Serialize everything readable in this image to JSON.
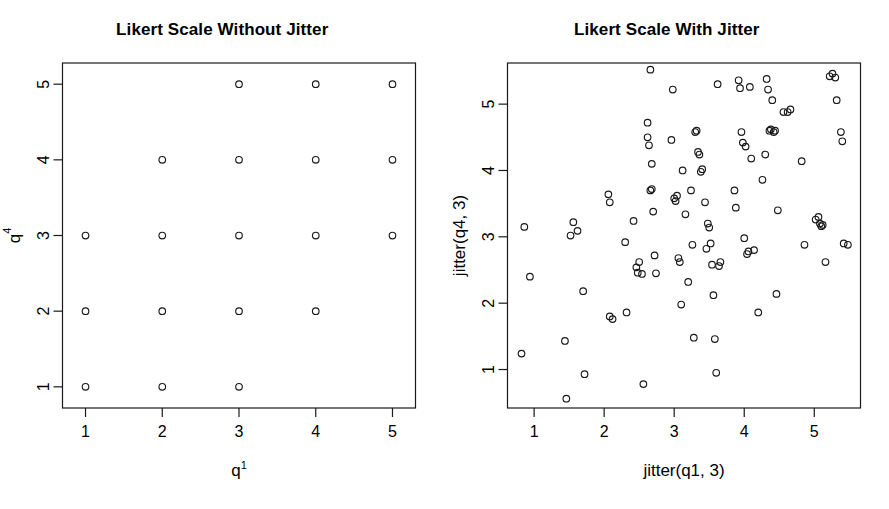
{
  "figure": {
    "background": "#ffffff",
    "foreground": "#1a1a1a",
    "panel_count": 2
  },
  "panels": [
    {
      "title": "Likert Scale Without Jitter",
      "xlabel_base": "q",
      "xlabel_sup": "1",
      "ylabel_base": "q",
      "ylabel_sup": "4",
      "xticks": [
        "1",
        "2",
        "3",
        "4",
        "5"
      ],
      "yticks": [
        "1",
        "2",
        "3",
        "4",
        "5"
      ]
    },
    {
      "title": "Likert Scale With Jitter",
      "xlabel_base": "jitter(q1, 3)",
      "xlabel_sup": "",
      "ylabel_base": "jitter(q4, 3)",
      "ylabel_sup": "",
      "xticks": [
        "1",
        "2",
        "3",
        "4",
        "5"
      ],
      "yticks": [
        "1",
        "2",
        "3",
        "4",
        "5"
      ]
    }
  ],
  "chart_data": [
    {
      "type": "scatter",
      "title": "Likert Scale Without Jitter",
      "xlabel": "q1",
      "ylabel": "q4",
      "xlim": [
        0.7,
        5.3
      ],
      "ylim": [
        0.72,
        5.28
      ],
      "xticks": [
        1,
        2,
        3,
        4,
        5
      ],
      "yticks": [
        1,
        2,
        3,
        4,
        5
      ],
      "grid": false,
      "legend": null,
      "marker": "open-circle",
      "points": [
        [
          1,
          1
        ],
        [
          2,
          1
        ],
        [
          3,
          1
        ],
        [
          1,
          2
        ],
        [
          2,
          2
        ],
        [
          3,
          2
        ],
        [
          4,
          2
        ],
        [
          1,
          3
        ],
        [
          2,
          3
        ],
        [
          3,
          3
        ],
        [
          4,
          3
        ],
        [
          5,
          3
        ],
        [
          2,
          4
        ],
        [
          3,
          4
        ],
        [
          4,
          4
        ],
        [
          5,
          4
        ],
        [
          3,
          5
        ],
        [
          4,
          5
        ],
        [
          5,
          5
        ]
      ]
    },
    {
      "type": "scatter",
      "title": "Likert Scale With Jitter",
      "xlabel": "jitter(q1, 3)",
      "ylabel": "jitter(q4, 3)",
      "xlim": [
        0.62,
        5.66
      ],
      "ylim": [
        0.42,
        5.62
      ],
      "xticks": [
        1,
        2,
        3,
        4,
        5
      ],
      "yticks": [
        1,
        2,
        3,
        4,
        5
      ],
      "grid": false,
      "legend": null,
      "marker": "open-circle",
      "points": [
        [
          0.86,
          3.15
        ],
        [
          0.94,
          2.4
        ],
        [
          0.82,
          1.24
        ],
        [
          1.44,
          1.43
        ],
        [
          1.46,
          0.56
        ],
        [
          1.52,
          3.02
        ],
        [
          1.56,
          3.22
        ],
        [
          1.62,
          3.09
        ],
        [
          1.7,
          2.18
        ],
        [
          1.72,
          0.93
        ],
        [
          2.06,
          3.64
        ],
        [
          2.08,
          3.52
        ],
        [
          2.08,
          1.8
        ],
        [
          2.12,
          1.76
        ],
        [
          2.3,
          2.92
        ],
        [
          2.32,
          1.86
        ],
        [
          2.42,
          3.24
        ],
        [
          2.46,
          2.54
        ],
        [
          2.48,
          2.46
        ],
        [
          2.5,
          2.62
        ],
        [
          2.54,
          2.44
        ],
        [
          2.56,
          0.78
        ],
        [
          2.62,
          4.72
        ],
        [
          2.62,
          4.5
        ],
        [
          2.64,
          4.38
        ],
        [
          2.66,
          5.52
        ],
        [
          2.66,
          3.7
        ],
        [
          2.68,
          3.72
        ],
        [
          2.68,
          4.1
        ],
        [
          2.7,
          3.38
        ],
        [
          2.72,
          2.72
        ],
        [
          2.74,
          2.45
        ],
        [
          2.96,
          4.46
        ],
        [
          2.98,
          5.22
        ],
        [
          3.0,
          3.58
        ],
        [
          3.02,
          3.54
        ],
        [
          3.04,
          3.62
        ],
        [
          3.06,
          2.68
        ],
        [
          3.08,
          2.62
        ],
        [
          3.1,
          1.98
        ],
        [
          3.12,
          4.0
        ],
        [
          3.16,
          3.34
        ],
        [
          3.2,
          2.32
        ],
        [
          3.24,
          3.7
        ],
        [
          3.26,
          2.88
        ],
        [
          3.28,
          1.48
        ],
        [
          3.3,
          4.58
        ],
        [
          3.32,
          4.6
        ],
        [
          3.34,
          4.28
        ],
        [
          3.36,
          4.24
        ],
        [
          3.38,
          3.98
        ],
        [
          3.4,
          4.02
        ],
        [
          3.44,
          3.52
        ],
        [
          3.46,
          2.82
        ],
        [
          3.48,
          3.2
        ],
        [
          3.5,
          3.14
        ],
        [
          3.52,
          2.9
        ],
        [
          3.54,
          2.58
        ],
        [
          3.56,
          2.12
        ],
        [
          3.58,
          1.46
        ],
        [
          3.6,
          0.95
        ],
        [
          3.62,
          5.3
        ],
        [
          3.64,
          2.56
        ],
        [
          3.66,
          2.62
        ],
        [
          3.86,
          3.7
        ],
        [
          3.88,
          3.44
        ],
        [
          3.92,
          5.36
        ],
        [
          3.94,
          5.24
        ],
        [
          3.96,
          4.58
        ],
        [
          3.98,
          4.42
        ],
        [
          4.0,
          2.98
        ],
        [
          4.02,
          4.36
        ],
        [
          4.04,
          2.74
        ],
        [
          4.06,
          2.78
        ],
        [
          4.08,
          5.26
        ],
        [
          4.1,
          4.18
        ],
        [
          4.14,
          2.8
        ],
        [
          4.2,
          1.86
        ],
        [
          4.26,
          3.86
        ],
        [
          4.3,
          4.24
        ],
        [
          4.32,
          5.38
        ],
        [
          4.34,
          5.22
        ],
        [
          4.36,
          4.6
        ],
        [
          4.38,
          4.62
        ],
        [
          4.4,
          5.06
        ],
        [
          4.42,
          4.58
        ],
        [
          4.44,
          4.6
        ],
        [
          4.46,
          2.14
        ],
        [
          4.48,
          3.4
        ],
        [
          4.56,
          4.88
        ],
        [
          4.62,
          4.88
        ],
        [
          4.66,
          4.92
        ],
        [
          4.82,
          4.14
        ],
        [
          4.86,
          2.88
        ],
        [
          5.02,
          3.26
        ],
        [
          5.06,
          3.3
        ],
        [
          5.08,
          3.2
        ],
        [
          5.1,
          3.16
        ],
        [
          5.12,
          3.18
        ],
        [
          5.16,
          2.62
        ],
        [
          5.22,
          5.42
        ],
        [
          5.26,
          5.46
        ],
        [
          5.3,
          5.4
        ],
        [
          5.32,
          5.06
        ],
        [
          5.38,
          4.58
        ],
        [
          5.4,
          4.44
        ],
        [
          5.42,
          2.9
        ],
        [
          5.48,
          2.88
        ]
      ]
    }
  ]
}
